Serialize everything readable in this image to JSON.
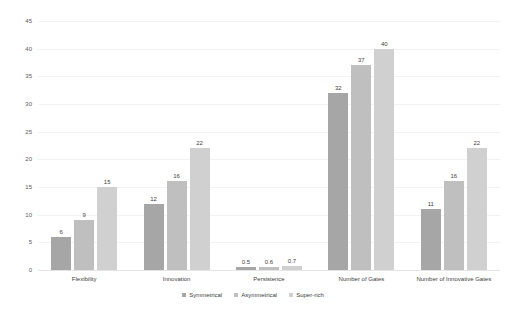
{
  "chart_data": {
    "type": "bar",
    "title": "",
    "subtitle": "",
    "xlabel": "",
    "ylabel": "",
    "ylim": [
      0,
      45
    ],
    "yticks": [
      0,
      5,
      10,
      15,
      20,
      25,
      30,
      35,
      40,
      45
    ],
    "ytick_labels": [
      "0",
      "5",
      "10",
      "15",
      "20",
      "25",
      "30",
      "35",
      "40",
      "45"
    ],
    "grid": true,
    "legend_position": "bottom-center",
    "categories": [
      "Flexibility",
      "Innovation",
      "Persistence",
      "Number of Gates",
      "Number of Innovative Gates"
    ],
    "series": [
      {
        "name": "Symmetrical",
        "color": "#a6a6a6",
        "values": [
          6,
          12,
          0.5,
          32,
          11
        ],
        "labels": [
          "6",
          "12",
          "0.5",
          "32",
          "11"
        ]
      },
      {
        "name": "Asymmetrical",
        "color": "#bfbfbf",
        "values": [
          9,
          16,
          0.6,
          37,
          16
        ],
        "labels": [
          "9",
          "16",
          "0.6",
          "37",
          "16"
        ]
      },
      {
        "name": "Super-rich",
        "color": "#d0d0d0",
        "values": [
          15,
          22,
          0.7,
          40,
          22
        ],
        "labels": [
          "15",
          "22",
          "0.7",
          "40",
          "22"
        ]
      }
    ]
  },
  "colors": {
    "background": "#ffffff",
    "gridline": "#f2f2f2",
    "axis_text": "#595959",
    "label_text": "#404040"
  }
}
